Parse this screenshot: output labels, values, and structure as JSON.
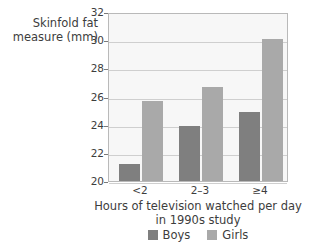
{
  "chart_data": {
    "type": "bar",
    "title": "",
    "ylabel": "Skinfold fat\nmeasure (mm)",
    "ylabel_line1": "Skinfold fat",
    "ylabel_line2": "measure (mm)",
    "xlabel_line1": "Hours of television watched per day",
    "xlabel_line2": "in 1990s study",
    "categories": [
      "<2",
      "2–3",
      "≥4"
    ],
    "series": [
      {
        "name": "Boys",
        "color": "#7f7f7f",
        "values": [
          21.2,
          23.9,
          24.9
        ]
      },
      {
        "name": "Girls",
        "color": "#a9a9a9",
        "values": [
          25.7,
          26.7,
          30.1
        ]
      }
    ],
    "ylim": [
      20,
      32
    ],
    "yticks": [
      "32",
      "30",
      "28",
      "26",
      "24",
      "22",
      "20"
    ],
    "ytick_values": [
      32,
      30,
      28,
      26,
      24,
      22,
      20
    ],
    "grid": true,
    "legend_position": "bottom"
  },
  "legend": {
    "items": [
      {
        "label": "Boys"
      },
      {
        "label": "Girls"
      }
    ]
  }
}
